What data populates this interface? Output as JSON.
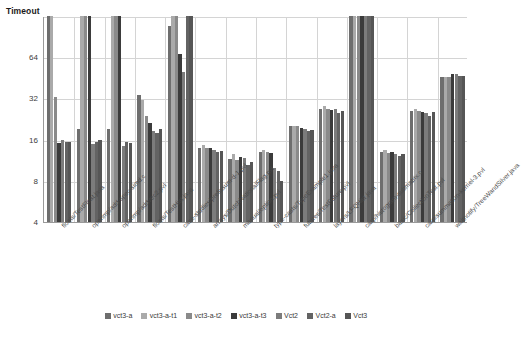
{
  "chart": {
    "type": "bar",
    "y_axis_title": "Timeout",
    "y_ticks": [
      "Timeout",
      "64",
      "32",
      "16",
      "8",
      "4"
    ]
  },
  "legend": {
    "position": "bottom",
    "items": [
      {
        "label": "vct3-a",
        "color": "#6e6e6e"
      },
      {
        "label": "vct3-a-t1",
        "color": "#aaaaaa"
      },
      {
        "label": "vct3-a-t2",
        "color": "#8a8a8a"
      },
      {
        "label": "vct3-a-t3",
        "color": "#3b3b3b"
      },
      {
        "label": "Vct2",
        "color": "#7c7c7c"
      },
      {
        "label": "Vct2-a",
        "color": "#636363"
      },
      {
        "label": "Vct3",
        "color": "#565656"
      }
    ]
  },
  "chart_data": {
    "type": "bar",
    "title": "",
    "xlabel": "",
    "ylabel": "Timeout",
    "yscale": "log2",
    "ylim": [
      4,
      128
    ],
    "ytick_values": [
      4,
      8,
      16,
      32,
      64,
      128
    ],
    "ytick_labels": [
      "4",
      "8",
      "16",
      "32",
      "64",
      "Timeout"
    ],
    "grid": true,
    "timeout_value": 128,
    "categories": [
      "floats/TestFloat.java",
      "openmp/add-spec-simd.c",
      "openmp/addvec2.pvl",
      "floats/TestHist.java",
      "case-studies/prefixsum-d-1.pvl",
      "arrays/DutchNationalFlag.pvl",
      "manual/option.pvl",
      "type-casts/TypeExample1.java",
      "futures/TestFuture.pvl",
      "layers/LFQHist.java",
      "carp/histogram-submatrix.c",
      "basic/CollectionTest.pvl",
      "carp/summation-kernel-3.pvl",
      "waitnotify/TreeWandSilver.java"
    ],
    "series": [
      {
        "name": "vct3-a",
        "color": "#6e6e6e",
        "values": [
          128,
          19,
          19,
          34,
          108,
          14,
          11.5,
          13,
          20,
          27,
          128,
          13,
          26,
          46
        ]
      },
      {
        "name": "vct3-a-t1",
        "color": "#aaaaaa",
        "values": [
          128,
          128,
          128,
          31,
          128,
          14.5,
          12.5,
          13.5,
          20,
          28,
          128,
          13.5,
          27,
          46
        ]
      },
      {
        "name": "vct3-a-t2",
        "color": "#8a8a8a",
        "values": [
          33,
          128,
          128,
          24,
          128,
          14,
          11.3,
          13,
          20,
          27,
          128,
          12.8,
          26,
          46
        ]
      },
      {
        "name": "vct3-a-t3",
        "color": "#3b3b3b",
        "values": [
          15,
          128,
          128,
          21,
          67,
          13.8,
          12,
          12.8,
          19.5,
          26.5,
          128,
          13,
          25.5,
          48
        ]
      },
      {
        "name": "Vct2",
        "color": "#7c7c7c",
        "values": [
          15.8,
          14.8,
          14.3,
          18.5,
          50,
          13.5,
          11.8,
          10,
          19,
          27,
          128,
          12.5,
          25,
          48
        ]
      },
      {
        "name": "Vct2-a",
        "color": "#636363",
        "values": [
          15.5,
          15.5,
          15.3,
          17.8,
          128,
          13,
          10.5,
          9.5,
          18.5,
          25,
          128,
          12.2,
          24,
          47
        ]
      },
      {
        "name": "Vct3",
        "color": "#565656",
        "values": [
          15.3,
          15.8,
          15.2,
          19,
          128,
          13.3,
          11,
          8,
          18.8,
          26,
          128,
          12.6,
          25.5,
          47
        ]
      }
    ]
  }
}
